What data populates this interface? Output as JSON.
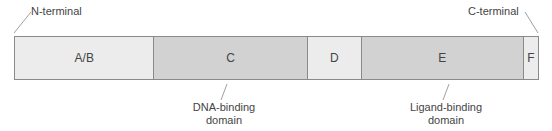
{
  "diagram": {
    "terminals": {
      "n": "N-terminal",
      "c": "C-terminal"
    },
    "segments": [
      {
        "id": "AB",
        "label": "A/B",
        "width": 140,
        "shade": "light"
      },
      {
        "id": "C",
        "label": "C",
        "width": 154,
        "shade": "dark"
      },
      {
        "id": "D",
        "label": "D",
        "width": 54,
        "shade": "light"
      },
      {
        "id": "E",
        "label": "E",
        "width": 163,
        "shade": "dark"
      },
      {
        "id": "F",
        "label": "F",
        "width": 14,
        "shade": "light"
      }
    ],
    "annotations": {
      "dna_binding": [
        "DNA-binding",
        "domain"
      ],
      "ligand_binding": [
        "Ligand-binding",
        "domain"
      ]
    },
    "colors": {
      "light": "#ececec",
      "dark": "#d2d2d2",
      "border": "#8a8a8a"
    }
  }
}
